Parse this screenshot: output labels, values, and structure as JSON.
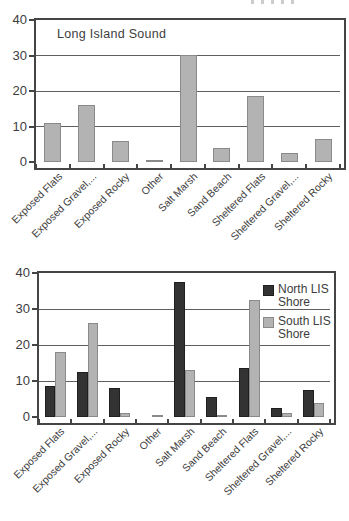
{
  "figure": {
    "background": "#ffffff",
    "text_color": "#3d3d3d",
    "grid_color": "#5f5f5f",
    "axis_color": "#454545"
  },
  "chart_data": [
    {
      "type": "bar",
      "title": "Long Island Sound",
      "categories": [
        "Exposed Flats",
        "Exposed Gravel,...",
        "Exposed Rocky",
        "Other",
        "Salt Marsh",
        "Sand Beach",
        "Sheltered Flats",
        "Sheltered Gravel,...",
        "Sheltered Rocky"
      ],
      "series": [
        {
          "name": "Long Island Sound",
          "color": "#b3b3b3",
          "border_color": "#8a8a8a",
          "values": [
            11,
            16,
            6,
            0.3,
            30,
            4,
            18.5,
            2.5,
            6.5
          ]
        }
      ],
      "ylim": [
        0,
        40
      ],
      "yticks": [
        0,
        10,
        20,
        30,
        40
      ],
      "grid": "horizontal",
      "legend": "none",
      "x_label_rotation_deg": 45
    },
    {
      "type": "bar",
      "title": "",
      "categories": [
        "Exposed Flats",
        "Exposed Gravel,...",
        "Exposed Rocky",
        "Other",
        "Salt Marsh",
        "Sand Beach",
        "Sheltered Flats",
        "Sheltered Gravel,...",
        "Sheltered Rocky"
      ],
      "series": [
        {
          "name": "North LIS Shore",
          "color": "#333333",
          "border_color": "#1f1f1f",
          "values": [
            8.5,
            12.5,
            8,
            0,
            37.5,
            5.5,
            13.5,
            2.5,
            7.5
          ]
        },
        {
          "name": "South LIS Shore",
          "color": "#b3b3b3",
          "border_color": "#8a8a8a",
          "values": [
            18,
            26,
            1,
            0.3,
            13,
            0.5,
            32.5,
            1,
            3.8
          ]
        }
      ],
      "ylim": [
        0,
        40
      ],
      "yticks": [
        0,
        10,
        20,
        30,
        40
      ],
      "grid": "horizontal",
      "legend": "inside-top-right",
      "x_label_rotation_deg": 45
    }
  ]
}
